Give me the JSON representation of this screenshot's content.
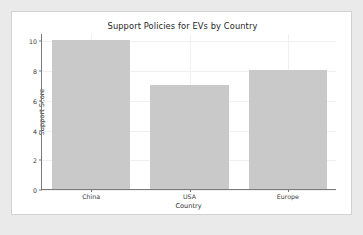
{
  "figure": {
    "background_color": "#ffffff",
    "page_background_color": "#eaeaea",
    "border_color": "#d2d2d2"
  },
  "chart_data": {
    "type": "bar",
    "title": "Support Policies for EVs by Country",
    "xlabel": "Country",
    "ylabel": "Support Score",
    "categories": [
      "China",
      "USA",
      "Europe"
    ],
    "values": [
      10,
      7,
      8
    ],
    "ylim": [
      0,
      10.5
    ],
    "yticks": [
      0,
      2,
      4,
      6,
      8,
      10
    ],
    "ytick_labels": [
      "0",
      "2",
      "4",
      "6",
      "8",
      "10"
    ],
    "grid": true,
    "legend": null,
    "bar_color": "#c9c9c9",
    "bar_width_ratio": 0.8
  }
}
